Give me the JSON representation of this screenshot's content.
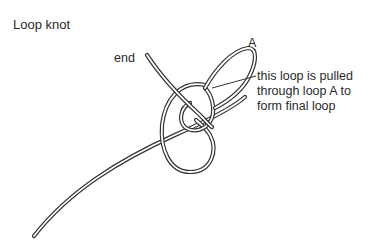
{
  "diagram": {
    "title": "Loop knot",
    "labels": {
      "end": "end",
      "a": "A",
      "note_line1": "this loop is pulled",
      "note_line2": "through loop A to",
      "note_line3": "form final loop"
    },
    "colors": {
      "stroke": "#333333",
      "background": "#ffffff"
    }
  }
}
